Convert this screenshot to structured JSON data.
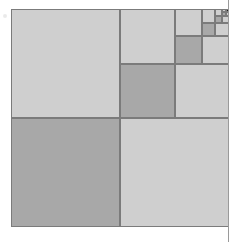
{
  "figure": {
    "type": "geometric-diagram",
    "caption": "",
    "canvas": {
      "width": 234,
      "height": 242,
      "background": "#ffffff"
    },
    "root_square": {
      "x": 11,
      "y": 9,
      "size": 218
    },
    "recursion": {
      "depth": 6,
      "split_ratio": 0.5,
      "rule": "Each square is divided into four equal quadrants; the top-left, bottom-right quadrants are light, the bottom-left quadrant is dark, and the top-right quadrant is subdivided again.",
      "recursing_quadrant": "top-right",
      "terminal_fill": "#1a1a1a"
    },
    "colors": {
      "light": "#cfcfcf",
      "dark": "#a8a8a8",
      "terminal": "#1a1a1a",
      "stroke": "#7b7b7b",
      "page_rule": "#9a9a9a",
      "background": "#ffffff"
    },
    "levels": [
      {
        "level": 1,
        "size": 218,
        "top_left": "light",
        "bottom_left": "dark",
        "bottom_right": "light",
        "top_right": "subdivide"
      },
      {
        "level": 2,
        "size": 109,
        "top_left": "light",
        "bottom_left": "dark",
        "bottom_right": "light",
        "top_right": "subdivide"
      },
      {
        "level": 3,
        "size": 54.5,
        "top_left": "light",
        "bottom_left": "dark",
        "bottom_right": "light",
        "top_right": "subdivide"
      },
      {
        "level": 4,
        "size": 27.25,
        "top_left": "light",
        "bottom_left": "dark",
        "bottom_right": "light",
        "top_right": "subdivide"
      },
      {
        "level": 5,
        "size": 13.6,
        "top_left": "light",
        "bottom_left": "dark",
        "bottom_right": "light",
        "top_right": "subdivide"
      },
      {
        "level": 6,
        "size": 6.8,
        "top_left": "light",
        "bottom_left": "dark",
        "bottom_right": "light",
        "top_right": "terminal"
      }
    ],
    "page_rule": {
      "x": 228,
      "width": 1
    },
    "scan_speck": {
      "x": 3,
      "y": 14,
      "size": 4
    }
  }
}
